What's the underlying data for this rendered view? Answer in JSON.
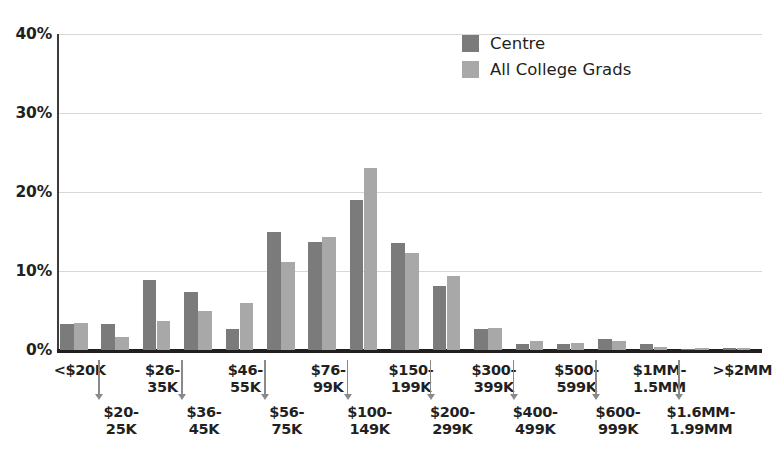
{
  "chart_data": {
    "type": "bar",
    "title": "",
    "xlabel": "",
    "ylabel": "",
    "ylim": [
      0,
      40
    ],
    "yticks": [
      "0%",
      "10%",
      "20%",
      "30%",
      "40%"
    ],
    "ytick_values": [
      0,
      10,
      20,
      30,
      40
    ],
    "grid": true,
    "legend_position": "top-right",
    "categories": [
      "<$20K",
      "$20-\n25K",
      "$26-\n35K",
      "$36-\n45K",
      "$46-\n55K",
      "$56-\n75K",
      "$76-\n99K",
      "$100-\n149K",
      "$150-\n199K",
      "$200-\n299K",
      "$300-\n399K",
      "$400-\n499K",
      "$500-\n599K",
      "$600-\n999K",
      "$1MM-\n1.5MM",
      "$1.6MM-\n1.99MM",
      ">$2MM"
    ],
    "series": [
      {
        "name": "Centre",
        "color": "#7b7b7b",
        "values": [
          3.3,
          3.3,
          8.8,
          7.3,
          2.6,
          15.0,
          13.7,
          19.0,
          13.5,
          8.1,
          2.6,
          0.7,
          0.8,
          1.4,
          0.7,
          0.1,
          0.2
        ]
      },
      {
        "name": "All College Grads",
        "color": "#a8a8a8",
        "values": [
          3.4,
          1.7,
          3.7,
          5.0,
          6.0,
          11.2,
          14.3,
          23.0,
          12.3,
          9.4,
          2.8,
          1.1,
          0.9,
          1.2,
          0.4,
          0.2,
          0.2
        ]
      }
    ]
  },
  "legend": {
    "items": [
      {
        "label": "Centre",
        "color": "#7b7b7b"
      },
      {
        "label": "All College Grads",
        "color": "#a8a8a8"
      }
    ]
  },
  "axis": {
    "y_labels": [
      "40%",
      "30%",
      "20%",
      "10%",
      "0%"
    ]
  },
  "x_axis": {
    "top_labels": [
      "<$20K",
      "$26-\n35K",
      "$46-\n55K",
      "$76-\n99K",
      "$150-\n199K",
      "$300-\n399K",
      "$500-\n599K",
      "$1MM-\n1.5MM",
      ">$2MM"
    ],
    "bottom_labels": [
      "$20-\n25K",
      "$36-\n45K",
      "$56-\n75K",
      "$100-\n149K",
      "$200-\n299K",
      "$400-\n499K",
      "$600-\n999K",
      "$1.6MM-\n1.99MM"
    ]
  },
  "colors": {
    "centre": "#7b7b7b",
    "all_college_grads": "#a8a8a8",
    "axis": "#231f20",
    "gridline": "#d8d8d8",
    "tick_arrow": "#8a8a8a"
  }
}
